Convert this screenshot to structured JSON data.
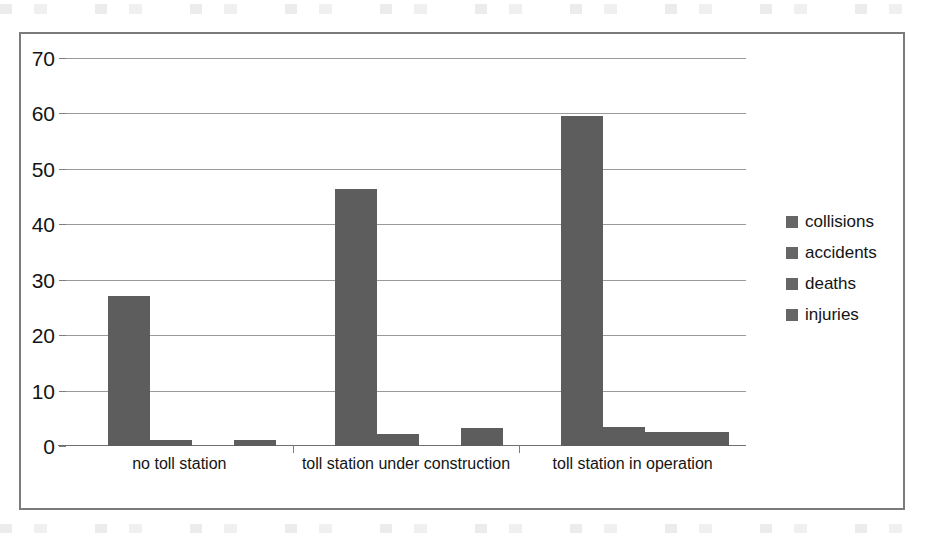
{
  "chart_data": {
    "type": "bar",
    "title": "",
    "xlabel": "",
    "ylabel": "",
    "ylim": [
      0,
      70
    ],
    "ytick_step": 10,
    "yticks": [
      70,
      60,
      50,
      40,
      30,
      20,
      10,
      0
    ],
    "grid": true,
    "legend_position": "right",
    "bar_color": "#5d5d5d",
    "categories": [
      "no toll station",
      "toll station under construction",
      "toll station in operation"
    ],
    "series": [
      {
        "name": "collisions",
        "values": [
          27,
          46.3,
          59.5
        ]
      },
      {
        "name": "accidents",
        "values": [
          1,
          2.2,
          3.4
        ]
      },
      {
        "name": "deaths",
        "values": [
          0,
          0,
          2.6
        ]
      },
      {
        "name": "injuries",
        "values": [
          1.1,
          3.3,
          2.6
        ]
      }
    ]
  },
  "legend": {
    "items": [
      {
        "label": "collisions"
      },
      {
        "label": "accidents"
      },
      {
        "label": "deaths"
      },
      {
        "label": "injuries"
      }
    ]
  }
}
